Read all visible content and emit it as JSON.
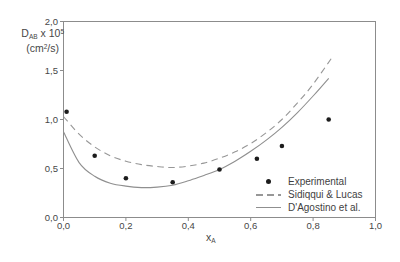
{
  "figure": {
    "background": "#ffffff",
    "text_color": "#3f3f3f",
    "axis_color": "#8c8c8c"
  },
  "chart_data": {
    "type": "scatter",
    "title": "",
    "xlabel": {
      "main": "x",
      "sub": "A"
    },
    "ylabel": {
      "main": "D",
      "sub": "AB",
      "mult": " x 10",
      "exp": "5",
      "unit_open": "(cm",
      "unit_exp": "2",
      "unit_close": "/s)"
    },
    "xlim": [
      0.0,
      1.0
    ],
    "ylim": [
      0.0,
      2.0
    ],
    "x_tick_values": [
      0,
      0.2,
      0.4,
      0.6,
      0.8,
      1.0
    ],
    "x_tick_labels": [
      "0,0",
      "0,2",
      "0,4",
      "0,6",
      "0,8",
      "1,0"
    ],
    "y_tick_values": [
      0,
      0.5,
      1.0,
      1.5,
      2.0
    ],
    "y_tick_labels": [
      "0,0",
      "0,5",
      "1,0",
      "1,5",
      "2,0"
    ],
    "decimal_separator": ",",
    "grid": false,
    "frame": "full-box",
    "legend_position": "inside-bottom-right",
    "series": [
      {
        "name": "Experimental",
        "type": "scatter",
        "marker": "filled-circle",
        "color": "#1c1c1c",
        "points": [
          [
            0.01,
            1.08
          ],
          [
            0.1,
            0.63
          ],
          [
            0.2,
            0.4
          ],
          [
            0.35,
            0.36
          ],
          [
            0.5,
            0.49
          ],
          [
            0.62,
            0.6
          ],
          [
            0.7,
            0.73
          ],
          [
            0.85,
            1.0
          ]
        ]
      },
      {
        "name": "Sidiqqui & Lucas",
        "type": "line",
        "style": "dashed",
        "color": "#979797",
        "points": [
          [
            0.0,
            1.03
          ],
          [
            0.05,
            0.85
          ],
          [
            0.1,
            0.72
          ],
          [
            0.15,
            0.63
          ],
          [
            0.2,
            0.575
          ],
          [
            0.25,
            0.54
          ],
          [
            0.3,
            0.52
          ],
          [
            0.35,
            0.51
          ],
          [
            0.4,
            0.525
          ],
          [
            0.45,
            0.555
          ],
          [
            0.5,
            0.605
          ],
          [
            0.55,
            0.67
          ],
          [
            0.6,
            0.755
          ],
          [
            0.65,
            0.865
          ],
          [
            0.7,
            1.0
          ],
          [
            0.75,
            1.17
          ],
          [
            0.8,
            1.36
          ],
          [
            0.86,
            1.63
          ]
        ]
      },
      {
        "name": "D'Agostino et al.",
        "type": "line",
        "style": "solid",
        "color": "#8f8f8f",
        "points": [
          [
            0.0,
            0.875
          ],
          [
            0.05,
            0.56
          ],
          [
            0.1,
            0.42
          ],
          [
            0.15,
            0.35
          ],
          [
            0.2,
            0.32
          ],
          [
            0.25,
            0.305
          ],
          [
            0.3,
            0.31
          ],
          [
            0.35,
            0.33
          ],
          [
            0.4,
            0.375
          ],
          [
            0.45,
            0.43
          ],
          [
            0.5,
            0.49
          ],
          [
            0.55,
            0.575
          ],
          [
            0.6,
            0.675
          ],
          [
            0.65,
            0.79
          ],
          [
            0.7,
            0.92
          ],
          [
            0.75,
            1.07
          ],
          [
            0.8,
            1.24
          ],
          [
            0.85,
            1.42
          ]
        ]
      }
    ]
  }
}
